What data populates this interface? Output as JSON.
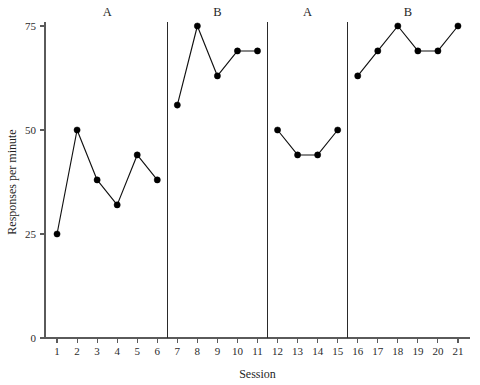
{
  "chart_data": {
    "type": "line",
    "title": "",
    "subtitle": "",
    "xlabel": "Session",
    "ylabel": "Responses per minute",
    "xlim": [
      0.4,
      21.6
    ],
    "ylim": [
      0,
      75
    ],
    "grid": false,
    "legend": null,
    "x_ticks": [
      1,
      2,
      3,
      4,
      5,
      6,
      7,
      8,
      9,
      10,
      11,
      12,
      13,
      14,
      15,
      16,
      17,
      18,
      19,
      20,
      21
    ],
    "x_tick_labels": [
      "1",
      "2",
      "3",
      "4",
      "5",
      "6",
      "7",
      "8",
      "9",
      "10",
      "11",
      "12",
      "13",
      "14",
      "15",
      "16",
      "17",
      "18",
      "19",
      "20",
      "21"
    ],
    "y_ticks": [
      0,
      25,
      50,
      75
    ],
    "y_tick_labels": [
      "0",
      "25",
      "50",
      "75"
    ],
    "x": [
      1,
      2,
      3,
      4,
      5,
      6,
      7,
      8,
      9,
      10,
      11,
      12,
      13,
      14,
      15,
      16,
      17,
      18,
      19,
      20,
      21
    ],
    "values": [
      25,
      50,
      38,
      32,
      44,
      38,
      56,
      75,
      63,
      69,
      69,
      50,
      44,
      44,
      50,
      63,
      69,
      75,
      69,
      69,
      75
    ],
    "series": [
      {
        "name": "Responses per minute",
        "marker": "filled-circle",
        "color": "#000000",
        "segments": [
          {
            "phase": "A",
            "phase_index": 1,
            "x": [
              1,
              2,
              3,
              4,
              5,
              6
            ],
            "values": [
              25,
              50,
              38,
              32,
              44,
              38
            ]
          },
          {
            "phase": "B",
            "phase_index": 2,
            "x": [
              7,
              8,
              9,
              10,
              11
            ],
            "values": [
              56,
              75,
              63,
              69,
              69
            ]
          },
          {
            "phase": "A",
            "phase_index": 3,
            "x": [
              12,
              13,
              14,
              15
            ],
            "values": [
              50,
              44,
              44,
              50
            ]
          },
          {
            "phase": "B",
            "phase_index": 4,
            "x": [
              16,
              17,
              18,
              19,
              20,
              21
            ],
            "values": [
              63,
              69,
              75,
              69,
              69,
              75
            ]
          }
        ]
      }
    ],
    "phase_labels": [
      {
        "label": "A",
        "center_x": 3.5
      },
      {
        "label": "B",
        "center_x": 9.0
      },
      {
        "label": "A",
        "center_x": 13.5
      },
      {
        "label": "B",
        "center_x": 18.5
      }
    ],
    "phase_dividers": [
      6.5,
      11.5,
      15.5
    ],
    "annotations": []
  }
}
